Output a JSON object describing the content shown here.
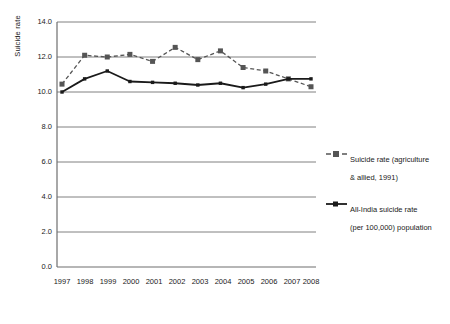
{
  "chart": {
    "type": "line",
    "ylabel": "Suicide rate",
    "xlabel": "",
    "title": ""
  },
  "chart_data": {
    "type": "line",
    "title": "",
    "xlabel": "",
    "ylabel": "Suicide rate",
    "x": [
      1997,
      1998,
      1999,
      2000,
      2001,
      2002,
      2003,
      2004,
      2005,
      2006,
      2007,
      2008
    ],
    "categories": [
      "1997",
      "1998",
      "1999",
      "2000",
      "2001",
      "2002",
      "2003",
      "2004",
      "2005",
      "2006",
      "2007",
      "2008"
    ],
    "series": [
      {
        "name": "Suicide rate (agriculture & allied, 1991)",
        "values": [
          10.45,
          12.1,
          12.0,
          12.15,
          11.75,
          12.55,
          11.85,
          12.35,
          11.4,
          11.2,
          10.75,
          10.3
        ],
        "style": "dashed",
        "marker": "square",
        "color": "#555555"
      },
      {
        "name": "All-India suicide rate (per 100,000) population",
        "values": [
          10.0,
          10.75,
          11.2,
          10.6,
          10.55,
          10.5,
          10.4,
          10.5,
          10.25,
          10.45,
          10.75,
          10.75
        ],
        "style": "solid",
        "marker": "square",
        "color": "#1a1a1a"
      }
    ],
    "ylim": [
      0.0,
      14.0
    ],
    "yticks": [
      "0.0",
      "2.0",
      "4.0",
      "6.0",
      "8.0",
      "10.0",
      "12.0",
      "14.0"
    ],
    "ytick_values": [
      0.0,
      2.0,
      4.0,
      6.0,
      8.0,
      10.0,
      12.0,
      14.0
    ],
    "grid": true,
    "grid_axis": "y",
    "legend_position": "right"
  },
  "legend": {
    "items": [
      {
        "label": "Suicide rate (agriculture\n& allied, 1991)",
        "style": "dashed",
        "color": "#555555"
      },
      {
        "label": "All-India suicide rate\n(per 100,000) population",
        "style": "solid",
        "color": "#1a1a1a"
      }
    ]
  },
  "colors": {
    "grid": "#808080",
    "axis": "#6e6e6e",
    "series_dashed": "#555555",
    "series_solid": "#1a1a1a",
    "background": "#ffffff",
    "text": "#1a1a1a"
  }
}
